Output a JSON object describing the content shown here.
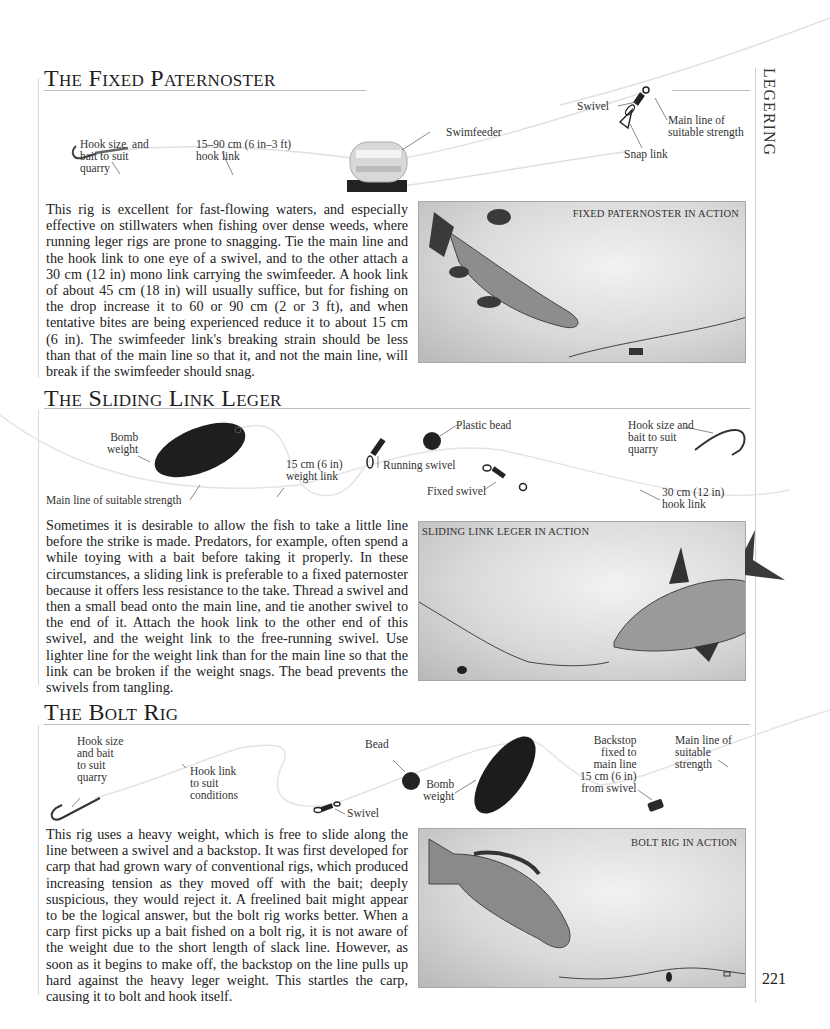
{
  "chapter_tab": "LEGERING",
  "page_number": "221",
  "sections": [
    {
      "title_prefix": "T",
      "title_rest": "he ",
      "title_word2_cap": "F",
      "title_word2_rest": "ixed ",
      "title_word3_cap": "P",
      "title_word3_rest": "aternoster",
      "title": "The Fixed Paternoster",
      "diagram_labels": {
        "hook": "Hook size  and\nbait to suit\nquarry",
        "hook_link": "15–90 cm (6 in–3 ft)\nhook link",
        "swimfeeder": "Swimfeeder",
        "swivel": "Swivel",
        "snap_link": "Snap link",
        "main_line": "Main line of\nsuitable strength"
      },
      "body": "This rig is excellent for fast-flowing waters, and especially effective on stillwaters when fishing over dense weeds, where running leger rigs are prone to snagging. Tie the main line and the hook link to one eye of a swivel, and to the other attach a 30 cm (12 in) mono link carrying the swimfeeder. A hook link of about 45 cm (18 in) will usually suffice, but for fishing on the drop increase it to 60 or 90 cm (2 or 3 ft), and when tentative bites are being experienced reduce it to about 15 cm (6 in). The swimfeeder link's breaking strain should be less than that of the main line so that it, and not the main line, will break if the swimfeeder should snag.",
      "panel_caption": "FIXED PATERNOSTER IN ACTION"
    },
    {
      "title": "The Sliding Link Leger",
      "diagram_labels": {
        "bomb": "Bomb\nweight",
        "main_line": "Main line of suitable strength",
        "weight_link": "15 cm (6 in)\nweight link",
        "running_swivel": "Running swivel",
        "plastic_bead": "Plastic bead",
        "fixed_swivel": "Fixed swivel",
        "hook": "Hook size and\nbait to suit\nquarry",
        "hook_link": "30 cm (12 in)\nhook link"
      },
      "body": "Sometimes it is desirable to allow the fish to take a little line before the strike is made. Predators, for example, often spend a while toying with a bait before taking it properly. In these circumstances, a sliding link is preferable to a fixed paternoster because it offers less resistance to the take. Thread a swivel and then a small bead onto the main line, and tie another swivel to the end of it. Attach the hook link to the other end of this swivel, and the weight link to the free-running swivel. Use lighter line for the weight link than for the main line so that the link can be broken if the weight snags. The bead prevents the swivels from tangling.",
      "panel_caption": "SLIDING LINK LEGER IN ACTION"
    },
    {
      "title": "The Bolt Rig",
      "diagram_labels": {
        "hook": "Hook size\nand bait\nto suit\nquarry",
        "hook_link": "Hook link\nto suit\nconditions",
        "swivel": "Swivel",
        "bead": "Bead",
        "bomb": "Bomb\nweight",
        "backstop": "Backstop\nfixed to\nmain line\n15 cm (6 in)\nfrom swivel",
        "main_line": "Main line of\nsuitable\nstrength"
      },
      "body": "This rig uses a heavy weight, which is free to slide along the line between a swivel and a backstop. It was first developed for carp that had grown wary of conventional rigs, which produced increasing tension as they moved off with the bait; deeply suspicious, they would reject it. A freelined bait might appear to be the logical answer, but the bolt rig works better. When a carp first picks up a bait fished on a bolt rig, it is not aware of the weight due to the short length of slack line. However, as soon as it begins to make off, the backstop on the line pulls up hard against the heavy leger weight. This startles the carp, causing it to bolt and hook itself.",
      "panel_caption": "BOLT RIG IN ACTION"
    }
  ],
  "icons": {
    "hook": "fish-hook-icon",
    "swivel": "swivel-icon",
    "bead": "bead-icon",
    "bomb": "bomb-weight-icon",
    "swimfeeder": "swimfeeder-icon",
    "backstop": "backstop-icon",
    "fish": "fish-illustration"
  }
}
